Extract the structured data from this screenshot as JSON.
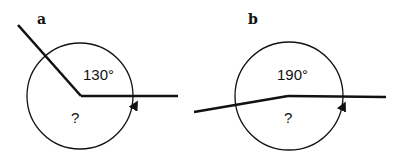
{
  "panels": [
    {
      "label": "a",
      "given_angle": "130°",
      "unknown": "?"
    },
    {
      "label": "b",
      "given_angle": "190°",
      "unknown": "?"
    }
  ],
  "colors": {
    "stroke": "#111111",
    "background": "#ffffff"
  }
}
